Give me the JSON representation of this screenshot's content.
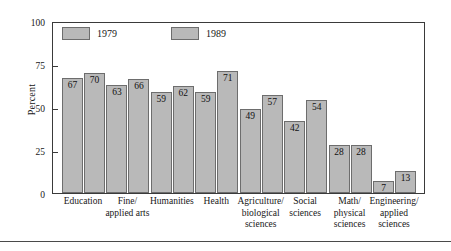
{
  "chart_data": {
    "type": "bar",
    "title": "",
    "subtitle": "",
    "xlabel": "",
    "ylabel": "Percent",
    "ylim": [
      0,
      100
    ],
    "yticks": [
      0,
      25,
      50,
      75,
      100
    ],
    "ytick_labels": [
      "0",
      "25",
      "50",
      "75",
      "100"
    ],
    "grid": false,
    "legend_position": "top-left-inside",
    "categories": [
      "Education",
      "Fine/ applied arts",
      "Humanities",
      "Health",
      "Agriculture/ biological sciences",
      "Social sciences",
      "Math/ physical sciences",
      "Engineering/ applied sciences"
    ],
    "category_lines": [
      [
        "Education"
      ],
      [
        "Fine/",
        "applied arts"
      ],
      [
        "Humanities"
      ],
      [
        "Health"
      ],
      [
        "Agriculture/",
        "biological",
        "sciences"
      ],
      [
        "Social",
        "sciences"
      ],
      [
        "Math/",
        "physical",
        "sciences"
      ],
      [
        "Engineering/",
        "applied",
        "sciences"
      ]
    ],
    "series": [
      {
        "name": "1979",
        "values": [
          67,
          63,
          59,
          59,
          49,
          42,
          28,
          7
        ]
      },
      {
        "name": "1989",
        "values": [
          70,
          66,
          62,
          71,
          57,
          54,
          28,
          13
        ]
      }
    ],
    "legend": [
      "1979",
      "1989"
    ],
    "colors": {
      "bar_fill": "#b9b9b9",
      "bar_border": "#6d6d6d",
      "axis": "#3a3a3a",
      "text": "#171717",
      "background": "#ffffff"
    }
  }
}
